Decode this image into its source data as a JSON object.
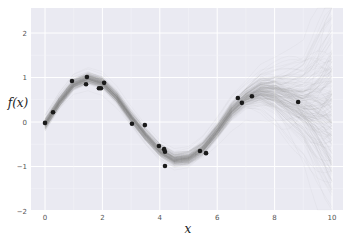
{
  "chart_data": {
    "type": "line",
    "title": "",
    "xlabel": "x",
    "ylabel": "f(x)",
    "xlim": [
      -0.5,
      10.5
    ],
    "ylim": [
      -2,
      2.5
    ],
    "xticks": [
      0,
      2,
      4,
      6,
      8,
      10
    ],
    "xtick_labels": [
      "0",
      "2",
      "4",
      "6",
      "8",
      "10"
    ],
    "yticks": [
      -2,
      -1,
      0,
      1,
      2
    ],
    "ytick_labels": [
      "−2",
      "−1",
      "0",
      "1",
      "2"
    ],
    "grid": true,
    "style": "seaborn-whitegrid-on-gray",
    "background_color": "#eaeaf2",
    "grid_color": "#ffffff",
    "legend": null,
    "series": [
      {
        "name": "observations",
        "kind": "scatter",
        "color": "#1a1a1a",
        "points": [
          [
            0.0,
            -0.02
          ],
          [
            0.28,
            0.22
          ],
          [
            0.94,
            0.92
          ],
          [
            1.43,
            0.85
          ],
          [
            1.46,
            1.01
          ],
          [
            1.88,
            0.76
          ],
          [
            1.95,
            0.76
          ],
          [
            2.06,
            0.88
          ],
          [
            3.03,
            -0.04
          ],
          [
            3.48,
            -0.07
          ],
          [
            3.97,
            -0.54
          ],
          [
            4.15,
            -0.61
          ],
          [
            4.18,
            -0.67
          ],
          [
            4.18,
            -0.99
          ],
          [
            5.4,
            -0.65
          ],
          [
            5.61,
            -0.7
          ],
          [
            6.72,
            0.54
          ],
          [
            6.86,
            0.43
          ],
          [
            7.21,
            0.58
          ],
          [
            8.82,
            0.45
          ]
        ]
      },
      {
        "name": "posterior samples",
        "kind": "line-bundle",
        "color": "#808080",
        "opacity": 0.06,
        "count": 200,
        "mean_curve": {
          "x": [
            0,
            0.5,
            1,
            1.5,
            2,
            2.5,
            3,
            3.5,
            4,
            4.5,
            5,
            5.5,
            6,
            6.5,
            7,
            7.5,
            8,
            8.5,
            9,
            9.5,
            10
          ],
          "y": [
            -0.05,
            0.45,
            0.85,
            0.98,
            0.88,
            0.55,
            0.1,
            -0.3,
            -0.65,
            -0.85,
            -0.82,
            -0.6,
            -0.2,
            0.25,
            0.55,
            0.7,
            0.65,
            0.5,
            0.35,
            0.25,
            0.2
          ]
        },
        "spread": {
          "x": [
            0,
            2,
            4,
            6,
            7,
            8,
            9,
            10
          ],
          "std": [
            0.06,
            0.06,
            0.06,
            0.08,
            0.1,
            0.22,
            0.4,
            0.9
          ]
        }
      }
    ]
  }
}
